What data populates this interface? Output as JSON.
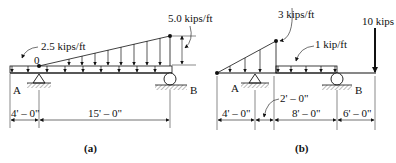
{
  "figure_a": {
    "caption": "(a)",
    "uniform_load": "2.5 kips/ft",
    "peak_load": "5.0 kips/ft",
    "point_label": "0",
    "support_left": "A",
    "support_right": "B",
    "dim_1": "4' – 0\"",
    "dim_2": "15' – 0\""
  },
  "figure_b": {
    "caption": "(b)",
    "triangular_load": "3 kips/ft",
    "uniform_load": "1 kip/ft",
    "point_load": "10 kips",
    "support_left": "A",
    "support_right": "B",
    "dim_1": "4' – 0\"",
    "dim_2": "2' – 0\"",
    "dim_3": "8' – 0\"",
    "dim_4": "6' – 0\""
  }
}
